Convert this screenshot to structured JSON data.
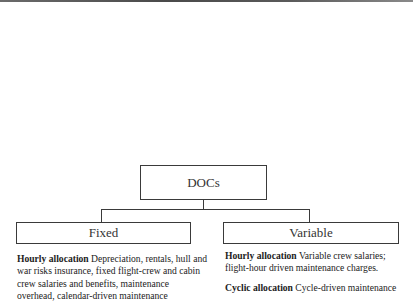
{
  "diagram": {
    "root": {
      "label": "DOCs"
    },
    "children": [
      {
        "label": "Fixed",
        "descriptions": [
          {
            "heading": "Hourly allocation",
            "text": "Depreciation, rentals, hull and war risks insurance, fixed flight-crew and cabin crew salaries and benefits, maintenance overhead, calendar-driven maintenance"
          }
        ]
      },
      {
        "label": "Variable",
        "descriptions": [
          {
            "heading": "Hourly allocation",
            "text": "Variable crew salaries; flight-hour driven maintenance charges."
          },
          {
            "heading": "Cyclic allocation",
            "text": "Cycle-driven maintenance"
          }
        ]
      }
    ],
    "colors": {
      "border": "#3a3a3a",
      "text": "#222222",
      "background": "#ffffff"
    }
  }
}
